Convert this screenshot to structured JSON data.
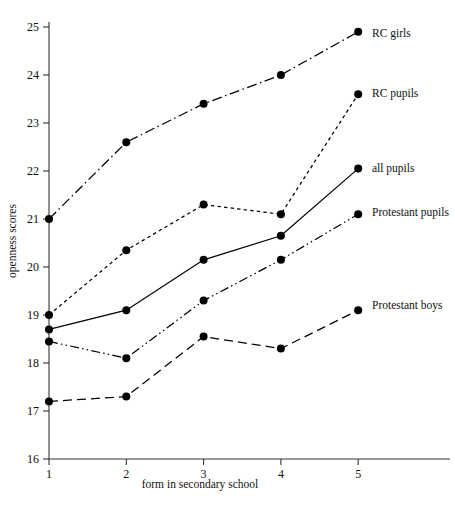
{
  "chart_data": {
    "type": "line",
    "title": "",
    "xlabel": "form in secondary school",
    "ylabel": "openness scores",
    "categories": [
      1,
      2,
      3,
      4,
      5
    ],
    "xtick_labels": [
      "1",
      "2",
      "3",
      "4",
      "5"
    ],
    "ytick_labels": [
      "16",
      "17",
      "18",
      "19",
      "20",
      "21",
      "22",
      "23",
      "24",
      "25"
    ],
    "xlim": [
      1,
      5
    ],
    "ylim": [
      16,
      25
    ],
    "grid": false,
    "legend_position": "right-inline-labels",
    "series": [
      {
        "name": "RC girls",
        "linestyle": "dash-dot",
        "color": "#000000",
        "values": [
          21.0,
          22.6,
          23.4,
          24.0,
          24.9
        ]
      },
      {
        "name": "RC pupils",
        "linestyle": "dashed-short",
        "color": "#000000",
        "values": [
          19.0,
          20.35,
          21.3,
          21.1,
          23.6
        ]
      },
      {
        "name": "all pupils",
        "linestyle": "solid",
        "color": "#000000",
        "values": [
          18.7,
          19.1,
          20.15,
          20.65,
          22.05
        ]
      },
      {
        "name": "Protestant pupils",
        "linestyle": "dash-dot-dot",
        "color": "#000000",
        "values": [
          18.45,
          18.1,
          19.3,
          20.15,
          21.1
        ]
      },
      {
        "name": "Protestant boys",
        "linestyle": "dashed-long",
        "color": "#000000",
        "values": [
          17.2,
          17.3,
          18.55,
          18.3,
          19.1
        ]
      }
    ]
  },
  "labels": {
    "series_0": "RC girls",
    "series_1": "RC pupils",
    "series_2": "all pupils",
    "series_3": "Protestant pupils",
    "series_4": "Protestant boys"
  }
}
